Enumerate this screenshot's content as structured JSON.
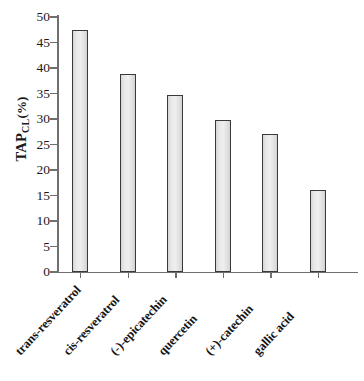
{
  "chart_data": {
    "type": "bar",
    "title": "",
    "xlabel": "",
    "ylabel": "TAP_CL(%)",
    "ylabel_main": "TAP",
    "ylabel_sub": "CL",
    "ylabel_unit": "(%)",
    "categories": [
      "trans-resveratrol",
      "cis-resveratrol",
      "(-)-epicatechin",
      "quercetin",
      "(+)-catechin",
      "gallic acid"
    ],
    "values": [
      47.4,
      38.8,
      34.7,
      29.9,
      27.0,
      16.1
    ],
    "ylim": [
      0,
      50
    ],
    "ytick_labels": [
      "0",
      "5",
      "10",
      "15",
      "20",
      "25",
      "30",
      "35",
      "40",
      "45",
      "50"
    ],
    "ytick_values": [
      0,
      5,
      10,
      15,
      20,
      25,
      30,
      35,
      40,
      45,
      50
    ],
    "grid": false,
    "legend": null,
    "bar_fill_color": "#e8e8e8",
    "bar_edge_color": "#3a3a3a",
    "axis_color": "#6f6f6f",
    "background_color": "#ffffff"
  }
}
